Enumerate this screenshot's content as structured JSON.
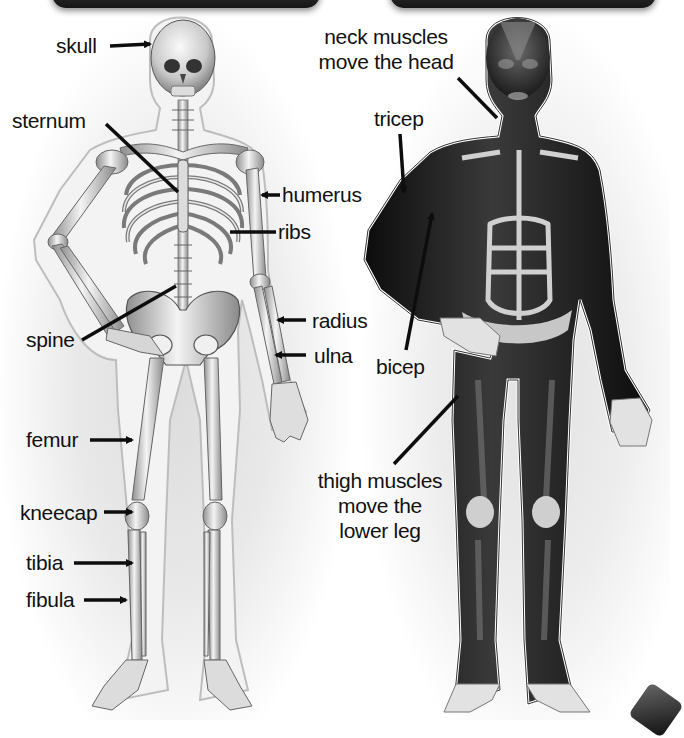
{
  "diagram": {
    "title_bars": {
      "left": {
        "color": "#1e1e1e"
      },
      "right": {
        "color": "#1e1e1e"
      }
    },
    "panels": [
      {
        "id": "skeleton",
        "subject": "human skeleton, front view",
        "labels": [
          {
            "key": "skull",
            "text": "skull"
          },
          {
            "key": "sternum",
            "text": "sternum"
          },
          {
            "key": "humerus",
            "text": "humerus"
          },
          {
            "key": "ribs",
            "text": "ribs"
          },
          {
            "key": "spine",
            "text": "spine"
          },
          {
            "key": "radius",
            "text": "radius"
          },
          {
            "key": "ulna",
            "text": "ulna"
          },
          {
            "key": "femur",
            "text": "femur"
          },
          {
            "key": "kneecap",
            "text": "kneecap"
          },
          {
            "key": "tibia",
            "text": "tibia"
          },
          {
            "key": "fibula",
            "text": "fibula"
          }
        ]
      },
      {
        "id": "muscles",
        "subject": "human muscular system, front view",
        "labels": [
          {
            "key": "neck",
            "text": "neck muscles move the head",
            "lines": [
              "neck muscles",
              "move the head"
            ]
          },
          {
            "key": "tricep",
            "text": "tricep"
          },
          {
            "key": "bicep",
            "text": "bicep"
          },
          {
            "key": "thigh",
            "text": "thigh muscles move the lower leg",
            "lines": [
              "thigh muscles",
              "move the",
              "lower leg"
            ]
          }
        ]
      }
    ],
    "colors": {
      "bone": "#e8e8e8",
      "bone_shade": "#9a9a9a",
      "muscle": "#1b1b1b",
      "muscle_highlight": "#5a5a5a",
      "outline": "#bdbdbd",
      "pointer": "#0d0d0d",
      "text": "#111111"
    }
  }
}
